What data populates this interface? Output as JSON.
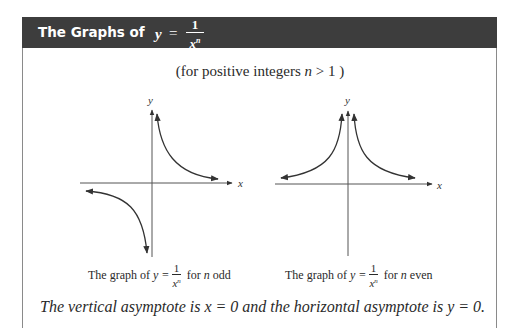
{
  "header": {
    "title_prefix": "The Graphs of",
    "var": "y",
    "eq": "=",
    "numerator": "1",
    "denominator_base": "x",
    "denominator_exp": "n",
    "bg_color": "#3d3d3d"
  },
  "subtitle": {
    "text_before": "(for positive integers",
    "var": "n",
    "text_after": "> 1 )"
  },
  "graphs": [
    {
      "name": "odd",
      "x_label": "x",
      "y_label": "y",
      "caption_prefix": "The graph of",
      "caption_var": "y =",
      "numerator": "1",
      "den_base": "x",
      "den_exp": "n",
      "caption_for": "for",
      "caption_n": "n",
      "caption_suffix": "odd"
    },
    {
      "name": "even",
      "x_label": "x",
      "y_label": "y",
      "caption_prefix": "The graph of",
      "caption_var": "y =",
      "numerator": "1",
      "den_base": "x",
      "den_exp": "n",
      "caption_for": "for",
      "caption_n": "n",
      "caption_suffix": "even"
    }
  ],
  "footer": {
    "text": "The vertical asymptote is x = 0 and the horizontal asymptote is y = 0."
  }
}
